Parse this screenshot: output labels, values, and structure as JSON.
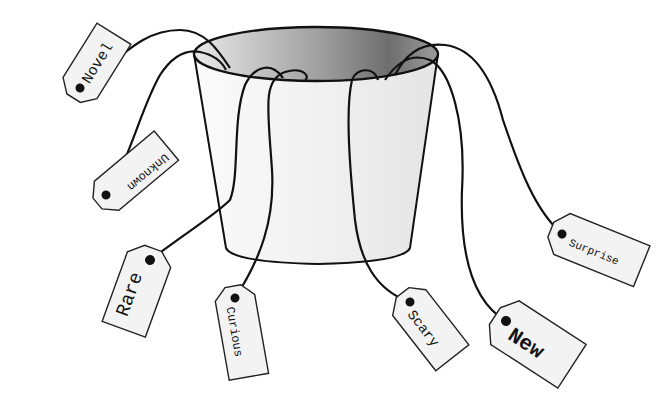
{
  "diagram": {
    "colors": {
      "stroke": "#111111",
      "tag_fill": "#f3f3f3",
      "bucket_light": "#f1f1f1",
      "bucket_inner_dark": "#777777",
      "bucket_inner_light": "#e8e8e8"
    },
    "tags": [
      {
        "label": "Novel",
        "font_size": 15
      },
      {
        "label": "Unknown",
        "font_size": 12
      },
      {
        "label": "Rare",
        "font_size": 19
      },
      {
        "label": "Curious",
        "font_size": 12
      },
      {
        "label": "Scary",
        "font_size": 14
      },
      {
        "label": "New",
        "font_size": 21
      },
      {
        "label": "Surprise",
        "font_size": 11
      }
    ]
  }
}
